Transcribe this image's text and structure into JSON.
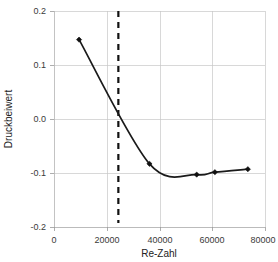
{
  "chart_data": {
    "type": "line",
    "title": "",
    "xlabel": "Re-Zahl",
    "ylabel": "Druckbeiwert",
    "xlim": [
      0,
      80000
    ],
    "ylim": [
      -0.2,
      0.2
    ],
    "grid": true,
    "legend": "none",
    "x_ticks": [
      0,
      20000,
      40000,
      60000,
      80000
    ],
    "x_tick_labels": [
      "0",
      "20000",
      "40000",
      "60000",
      "80000"
    ],
    "y_ticks": [
      0.2,
      0.1,
      0.0,
      -0.1,
      -0.2
    ],
    "y_tick_labels": [
      "0.2",
      "0.1",
      "0.0",
      "-0.1",
      "-0.2"
    ],
    "series": [
      {
        "name": "Druckbeiwert",
        "marker": "diamond",
        "color": "#111111",
        "x": [
          9500,
          36200,
          54100,
          61000,
          73500
        ],
        "y": [
          0.147,
          -0.083,
          -0.103,
          -0.0985,
          -0.093
        ]
      }
    ],
    "annotations": [
      {
        "type": "vertical-dashed-line",
        "x": 24400,
        "color": "#111111",
        "label": ""
      }
    ]
  },
  "axis": {
    "x_title": "Re-Zahl",
    "y_title": "Druckbeiwert"
  }
}
